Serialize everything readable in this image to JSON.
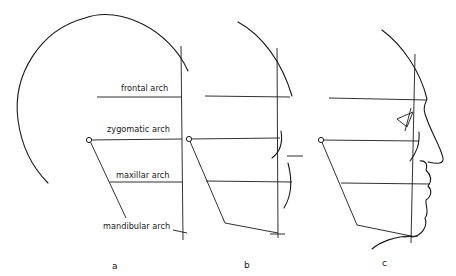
{
  "figure": {
    "labels": {
      "frontal": "frontal arch",
      "zygomatic": "zygomatic arch",
      "maxillar": "maxillar arch",
      "mandibular": "mandibular arch"
    },
    "panels": [
      {
        "id": "a",
        "label": "a"
      },
      {
        "id": "b",
        "label": "b"
      },
      {
        "id": "c",
        "label": "c"
      }
    ],
    "colors": {
      "stroke": "#1a1a1a",
      "background": "#ffffff"
    }
  }
}
